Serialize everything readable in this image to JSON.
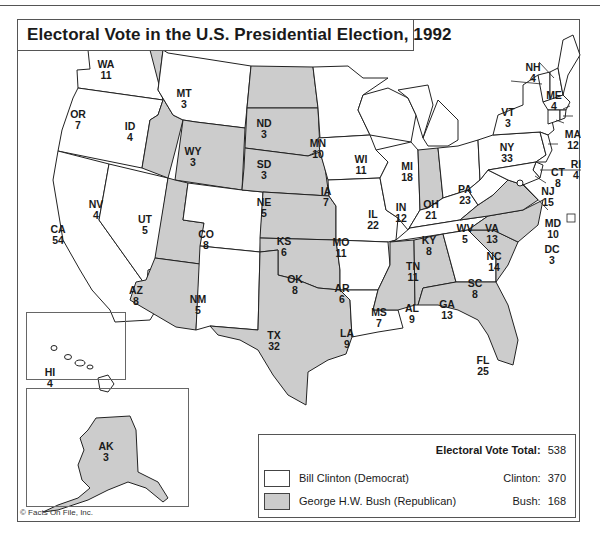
{
  "title": "Electoral Vote in the U.S. Presidential Election, 1992",
  "colors": {
    "clinton_fill": "#ffffff",
    "bush_fill": "#cccccc",
    "border": "#222222"
  },
  "legend": {
    "total_label": "Electoral Vote Total:",
    "total_value": "538",
    "items": [
      {
        "label": "Bill Clinton (Democrat)",
        "swatch": "clinton",
        "count_label": "Clinton:",
        "count_value": "370"
      },
      {
        "label": "George H.W. Bush (Republican)",
        "swatch": "bush",
        "count_label": "Bush:",
        "count_value": "168"
      }
    ]
  },
  "copyright": "© Facts On File, Inc.",
  "states": {
    "WA": {
      "abbr": "WA",
      "votes": "11",
      "winner": "clinton"
    },
    "OR": {
      "abbr": "OR",
      "votes": "7",
      "winner": "clinton"
    },
    "CA": {
      "abbr": "CA",
      "votes": "54",
      "winner": "clinton"
    },
    "NV": {
      "abbr": "NV",
      "votes": "4",
      "winner": "clinton"
    },
    "ID": {
      "abbr": "ID",
      "votes": "4",
      "winner": "bush"
    },
    "MT": {
      "abbr": "MT",
      "votes": "3",
      "winner": "clinton"
    },
    "WY": {
      "abbr": "WY",
      "votes": "3",
      "winner": "bush"
    },
    "UT": {
      "abbr": "UT",
      "votes": "5",
      "winner": "bush"
    },
    "CO": {
      "abbr": "CO",
      "votes": "8",
      "winner": "clinton"
    },
    "AZ": {
      "abbr": "AZ",
      "votes": "8",
      "winner": "bush"
    },
    "NM": {
      "abbr": "NM",
      "votes": "5",
      "winner": "clinton"
    },
    "ND": {
      "abbr": "ND",
      "votes": "3",
      "winner": "bush"
    },
    "SD": {
      "abbr": "SD",
      "votes": "3",
      "winner": "bush"
    },
    "NE": {
      "abbr": "NE",
      "votes": "5",
      "winner": "bush"
    },
    "KS": {
      "abbr": "KS",
      "votes": "6",
      "winner": "bush"
    },
    "OK": {
      "abbr": "OK",
      "votes": "8",
      "winner": "bush"
    },
    "TX": {
      "abbr": "TX",
      "votes": "32",
      "winner": "bush"
    },
    "MN": {
      "abbr": "MN",
      "votes": "10",
      "winner": "clinton"
    },
    "IA": {
      "abbr": "IA",
      "votes": "7",
      "winner": "clinton"
    },
    "MO": {
      "abbr": "MO",
      "votes": "11",
      "winner": "clinton"
    },
    "AR": {
      "abbr": "AR",
      "votes": "6",
      "winner": "clinton"
    },
    "LA": {
      "abbr": "LA",
      "votes": "9",
      "winner": "clinton"
    },
    "WI": {
      "abbr": "WI",
      "votes": "11",
      "winner": "clinton"
    },
    "IL": {
      "abbr": "IL",
      "votes": "22",
      "winner": "clinton"
    },
    "MI": {
      "abbr": "MI",
      "votes": "18",
      "winner": "clinton"
    },
    "IN": {
      "abbr": "IN",
      "votes": "12",
      "winner": "bush"
    },
    "OH": {
      "abbr": "OH",
      "votes": "21",
      "winner": "clinton"
    },
    "KY": {
      "abbr": "KY",
      "votes": "8",
      "winner": "clinton"
    },
    "TN": {
      "abbr": "TN",
      "votes": "11",
      "winner": "clinton"
    },
    "MS": {
      "abbr": "MS",
      "votes": "7",
      "winner": "bush"
    },
    "AL": {
      "abbr": "AL",
      "votes": "9",
      "winner": "bush"
    },
    "GA": {
      "abbr": "GA",
      "votes": "13",
      "winner": "clinton"
    },
    "FL": {
      "abbr": "FL",
      "votes": "25",
      "winner": "bush"
    },
    "SC": {
      "abbr": "SC",
      "votes": "8",
      "winner": "bush"
    },
    "NC": {
      "abbr": "NC",
      "votes": "14",
      "winner": "bush"
    },
    "VA": {
      "abbr": "VA",
      "votes": "13",
      "winner": "bush"
    },
    "WV": {
      "abbr": "WV",
      "votes": "5",
      "winner": "clinton"
    },
    "PA": {
      "abbr": "PA",
      "votes": "23",
      "winner": "clinton"
    },
    "NY": {
      "abbr": "NY",
      "votes": "33",
      "winner": "clinton"
    },
    "VT": {
      "abbr": "VT",
      "votes": "3",
      "winner": "clinton"
    },
    "NH": {
      "abbr": "NH",
      "votes": "4",
      "winner": "clinton"
    },
    "ME": {
      "abbr": "ME",
      "votes": "4",
      "winner": "clinton"
    },
    "MA": {
      "abbr": "MA",
      "votes": "12",
      "winner": "clinton"
    },
    "RI": {
      "abbr": "RI",
      "votes": "4",
      "winner": "clinton"
    },
    "CT": {
      "abbr": "CT",
      "votes": "8",
      "winner": "clinton"
    },
    "NJ": {
      "abbr": "NJ",
      "votes": "15",
      "winner": "clinton"
    },
    "DE": {
      "abbr": "DE",
      "votes": "3",
      "winner": "clinton"
    },
    "MD": {
      "abbr": "MD",
      "votes": "10",
      "winner": "clinton"
    },
    "DC": {
      "abbr": "DC",
      "votes": "3",
      "winner": "clinton"
    },
    "HI": {
      "abbr": "HI",
      "votes": "4",
      "winner": "clinton"
    },
    "AK": {
      "abbr": "AK",
      "votes": "3",
      "winner": "bush"
    }
  }
}
